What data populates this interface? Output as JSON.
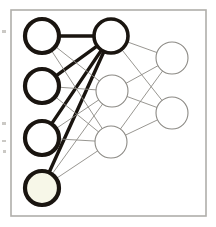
{
  "figure": {
    "type": "neural-network-diagram",
    "background_color": "#ffffff",
    "frame": {
      "x": 11,
      "y": 10,
      "width": 195,
      "height": 206,
      "stroke_color": "#b0aeaa",
      "stroke_width": 1.6
    },
    "canvas": {
      "width": 216,
      "height": 227
    }
  },
  "palette": {
    "bold_stroke": "#1a1510",
    "thin_stroke": "#8c8a85",
    "highlight_edge": "#1a1510",
    "node_fill_white": "#ffffff",
    "node_fill_cream": "#f7f7e8",
    "frame_stroke": "#b0aeaa",
    "margin_speck": "#b9b7b2"
  },
  "chart_data": {
    "type": "diagram",
    "layers": [
      {
        "name": "input",
        "label": "Input layer",
        "node_count": 4,
        "nodes": [
          {
            "id": "i1",
            "label": "",
            "cx": 42,
            "cy": 36,
            "r": 17,
            "stroke": "#1a1510",
            "stroke_width": 4.2,
            "fill": "#ffffff",
            "emphasis": "bold"
          },
          {
            "id": "i2",
            "label": "",
            "cx": 42,
            "cy": 86,
            "r": 17,
            "stroke": "#1a1510",
            "stroke_width": 4.2,
            "fill": "#ffffff",
            "emphasis": "bold"
          },
          {
            "id": "i3",
            "label": "",
            "cx": 42,
            "cy": 138,
            "r": 17,
            "stroke": "#1a1510",
            "stroke_width": 4.2,
            "fill": "#ffffff",
            "emphasis": "bold"
          },
          {
            "id": "i4",
            "label": "",
            "cx": 42,
            "cy": 188,
            "r": 17,
            "stroke": "#1a1510",
            "stroke_width": 4.2,
            "fill": "#f7f7e8",
            "emphasis": "bold"
          }
        ]
      },
      {
        "name": "hidden",
        "label": "Hidden layer",
        "node_count": 3,
        "nodes": [
          {
            "id": "h1",
            "label": "",
            "cx": 111,
            "cy": 36,
            "r": 17,
            "stroke": "#1a1510",
            "stroke_width": 3.6,
            "fill": "#ffffff",
            "emphasis": "bold"
          },
          {
            "id": "h2",
            "label": "",
            "cx": 112,
            "cy": 91,
            "r": 16,
            "stroke": "#8c8a85",
            "stroke_width": 1.1,
            "fill": "#ffffff",
            "emphasis": "faint"
          },
          {
            "id": "h3",
            "label": "",
            "cx": 111,
            "cy": 142,
            "r": 16,
            "stroke": "#8c8a85",
            "stroke_width": 1.1,
            "fill": "#ffffff",
            "emphasis": "faint"
          }
        ]
      },
      {
        "name": "output",
        "label": "Output layer",
        "node_count": 2,
        "nodes": [
          {
            "id": "o1",
            "label": "",
            "cx": 172,
            "cy": 58,
            "r": 16,
            "stroke": "#8c8a85",
            "stroke_width": 1.1,
            "fill": "#ffffff",
            "emphasis": "faint"
          },
          {
            "id": "o2",
            "label": "",
            "cx": 172,
            "cy": 113,
            "r": 16,
            "stroke": "#8c8a85",
            "stroke_width": 1.1,
            "fill": "#ffffff",
            "emphasis": "faint"
          }
        ]
      }
    ],
    "edges": [
      {
        "from": "i1",
        "to": "h1",
        "weight": "high",
        "stroke": "#1a1510",
        "stroke_width": 3.6
      },
      {
        "from": "i2",
        "to": "h1",
        "weight": "high",
        "stroke": "#1a1510",
        "stroke_width": 3.4
      },
      {
        "from": "i3",
        "to": "h1",
        "weight": "high",
        "stroke": "#1a1510",
        "stroke_width": 3.2
      },
      {
        "from": "i4",
        "to": "h1",
        "weight": "high",
        "stroke": "#1a1510",
        "stroke_width": 3.4
      },
      {
        "from": "i1",
        "to": "h2",
        "weight": "low",
        "stroke": "#8c8a85",
        "stroke_width": 0.9
      },
      {
        "from": "i1",
        "to": "h3",
        "weight": "low",
        "stroke": "#8c8a85",
        "stroke_width": 0.9
      },
      {
        "from": "i2",
        "to": "h2",
        "weight": "low",
        "stroke": "#8c8a85",
        "stroke_width": 0.9
      },
      {
        "from": "i2",
        "to": "h3",
        "weight": "low",
        "stroke": "#8c8a85",
        "stroke_width": 0.9
      },
      {
        "from": "i3",
        "to": "h2",
        "weight": "low",
        "stroke": "#8c8a85",
        "stroke_width": 0.9
      },
      {
        "from": "i3",
        "to": "h3",
        "weight": "low",
        "stroke": "#8c8a85",
        "stroke_width": 0.9
      },
      {
        "from": "i4",
        "to": "h2",
        "weight": "low",
        "stroke": "#8c8a85",
        "stroke_width": 0.9
      },
      {
        "from": "i4",
        "to": "h3",
        "weight": "low",
        "stroke": "#8c8a85",
        "stroke_width": 0.9
      },
      {
        "from": "h1",
        "to": "o1",
        "weight": "low",
        "stroke": "#8c8a85",
        "stroke_width": 0.9
      },
      {
        "from": "h1",
        "to": "o2",
        "weight": "low",
        "stroke": "#8c8a85",
        "stroke_width": 0.9
      },
      {
        "from": "h2",
        "to": "o1",
        "weight": "low",
        "stroke": "#8c8a85",
        "stroke_width": 0.9
      },
      {
        "from": "h2",
        "to": "o2",
        "weight": "low",
        "stroke": "#8c8a85",
        "stroke_width": 0.9
      },
      {
        "from": "h3",
        "to": "o1",
        "weight": "low",
        "stroke": "#8c8a85",
        "stroke_width": 0.9
      },
      {
        "from": "h3",
        "to": "o2",
        "weight": "low",
        "stroke": "#8c8a85",
        "stroke_width": 0.9
      }
    ],
    "legend": [],
    "annotations": []
  },
  "margin_specks": [
    {
      "x": 2,
      "y": 30,
      "width": 4,
      "height": 3
    },
    {
      "x": 2,
      "y": 122,
      "width": 4,
      "height": 3
    },
    {
      "x": 2,
      "y": 140,
      "width": 4,
      "height": 2
    },
    {
      "x": 3,
      "y": 150,
      "width": 3,
      "height": 3
    }
  ]
}
